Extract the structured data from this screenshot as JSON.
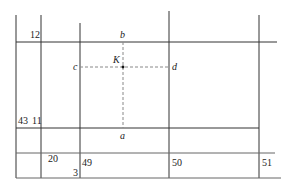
{
  "diagram": {
    "parcel_numbers": {
      "n12": "12",
      "n43": "43",
      "n11": "11",
      "n20": "20",
      "n3": "3",
      "n49": "49",
      "n50": "50",
      "n51": "51"
    },
    "points": {
      "a": "a",
      "b": "b",
      "c": "c",
      "d": "d",
      "K": "K"
    },
    "colors": {
      "line": "#333333",
      "dashed": "#888888",
      "text": "#222222"
    }
  }
}
